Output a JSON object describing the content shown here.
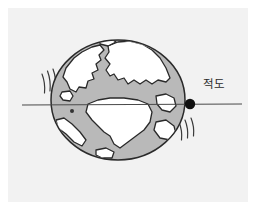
{
  "figure": {
    "panel": {
      "background_color": "#f2f2f2",
      "x": 8,
      "y": 8,
      "width": 240,
      "height": 194
    },
    "canvas_background_color": "#ffffff"
  },
  "globe": {
    "name": "earth-globe",
    "center_x": 118,
    "center_y": 100,
    "radius_x": 67,
    "radius_y": 60,
    "ocean_color": "#b9b9b9",
    "land_color": "#ffffff",
    "outline_color": "#2a2a2a",
    "outline_width": 1.4
  },
  "equator": {
    "name": "equator-line",
    "label": "적도",
    "line_color": "#4a4a4a",
    "line_width": 1.2,
    "y": 105,
    "x_start": 22,
    "x_end": 242,
    "marker": {
      "name": "equator-point-marker",
      "x": 190,
      "y": 104,
      "radius": 5.2,
      "color": "#111111"
    },
    "label_position": {
      "x": 203,
      "y": 78
    },
    "label_color": "#2b2b2b"
  },
  "motion_lines": {
    "name": "rotation-motion-lines",
    "color": "#3a3a3a",
    "width": 1.2,
    "upper_left_count": 3,
    "lower_right_count": 3
  },
  "small_marker": {
    "name": "surface-point-marker",
    "x": 72,
    "y": 111,
    "radius": 2.0,
    "color": "#333333"
  }
}
